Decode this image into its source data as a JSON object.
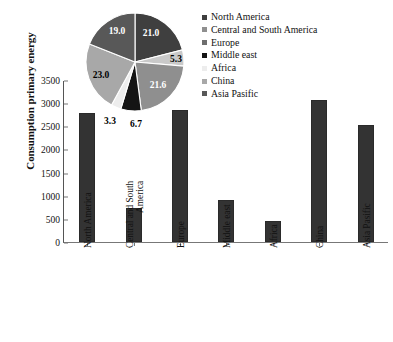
{
  "chart_data": {
    "type": "bar",
    "title": "",
    "xlabel": "",
    "ylabel": "Consumption primary energy",
    "ylim": [
      0,
      3500
    ],
    "ytick_step": 500,
    "yticks": [
      0,
      500,
      1000,
      1500,
      2000,
      2500,
      3000,
      3500
    ],
    "grid": false,
    "categories": [
      "North America",
      "Central and South America",
      "Europe",
      "Middle east",
      "Africa",
      "China",
      "Asia Pasific"
    ],
    "category_lines": [
      [
        "North America"
      ],
      [
        "Central and South",
        "America"
      ],
      [
        "Europe"
      ],
      [
        "Middle east"
      ],
      [
        "Africa"
      ],
      [
        "China"
      ],
      [
        "Asia Pasific"
      ]
    ],
    "values": [
      2780,
      730,
      2850,
      900,
      450,
      3060,
      2520
    ],
    "bar_color": "#333333",
    "inset_pie": {
      "type": "pie",
      "labels": [
        "North America",
        "Central and South America",
        "Europe",
        "Middle east",
        "Africa",
        "China",
        "Asia Pasific"
      ],
      "values": [
        21.0,
        5.3,
        21.6,
        6.7,
        3.3,
        23.0,
        19.0
      ],
      "value_labels": [
        "21.0",
        "5.3",
        "21.6",
        "6.7",
        "3.3",
        "23.0",
        "19.0"
      ],
      "colors": [
        "#3f3f3f",
        "#c9c9c9",
        "#8f8f8f",
        "#141414",
        "#ededed",
        "#a8a8a8",
        "#585858"
      ],
      "legend_position": "right"
    },
    "legend": {
      "entries": [
        {
          "label": "North America",
          "color": "#3f3f3f"
        },
        {
          "label": "Central and South America",
          "color": "#8f8f8f"
        },
        {
          "label": "Europe",
          "color": "#6e6e6e"
        },
        {
          "label": "Middle east",
          "color": "#141414"
        },
        {
          "label": "Africa",
          "color": "#ededed"
        },
        {
          "label": "China",
          "color": "#a8a8a8"
        },
        {
          "label": "Asia Pasific",
          "color": "#585858"
        }
      ]
    }
  }
}
